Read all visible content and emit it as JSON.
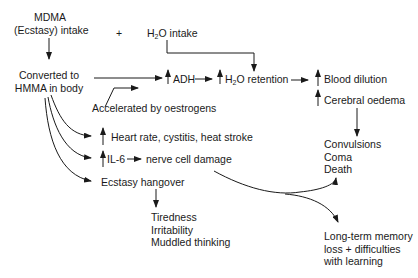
{
  "nodes": {
    "mdma_line1": "MDMA",
    "mdma_line2": "(Ecstasy) intake",
    "plus": "+",
    "water_h": "H",
    "water_sub": "2",
    "water_rest": "O intake",
    "converted_line1": "Converted to",
    "converted_line2": "HMMA in body",
    "adh": "ADH",
    "retention_h": "H",
    "retention_sub": "2",
    "retention_rest": "O retention",
    "blood_dilution": "Blood dilution",
    "cerebral_oedema": "Cerebral oedema",
    "accelerated": "Accelerated by oestrogens",
    "heart_rate": "Heart rate, cystitis, heat stroke",
    "il6": "IL-6",
    "nerve_damage": "nerve cell damage",
    "hangover": "Ecstasy hangover",
    "convulsions": "Convulsions",
    "coma": "Coma",
    "death": "Death",
    "tiredness": "Tiredness",
    "irritability": "Irritability",
    "muddled": "Muddled thinking",
    "memory_line1": "Long-term memory",
    "memory_line2": "loss + difficulties",
    "memory_line3": "with learning"
  },
  "colors": {
    "ink": "#1a1a1a",
    "background": "#ffffff"
  }
}
